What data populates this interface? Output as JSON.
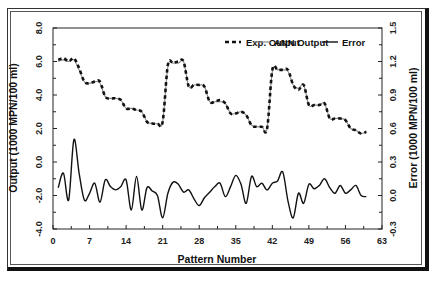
{
  "chart_data": {
    "type": "line",
    "title": "",
    "xlabel": "Pattern Number",
    "ylabel": "Output (1000 MPN/100 ml)",
    "y2label": "Error (1000 MPN/100 ml)",
    "xlim": [
      0,
      63
    ],
    "ylim": [
      -4.0,
      8.0
    ],
    "y2lim": [
      -0.3,
      1.5
    ],
    "x_ticks": [
      "0",
      "7",
      "14",
      "21",
      "28",
      "35",
      "42",
      "49",
      "56",
      "63"
    ],
    "y_ticks": [
      "-4.0",
      "-2.0",
      "0.0",
      "2.0",
      "4.0",
      "6.0",
      "8.0"
    ],
    "y2_ticks": [
      "-0.3",
      "0.0",
      "0.3",
      "0.6",
      "0.9",
      "1.2",
      "1.5"
    ],
    "grid": false,
    "legend_position": "top-right inside",
    "x": [
      1,
      2,
      3,
      4,
      5,
      6,
      7,
      8,
      9,
      10,
      11,
      12,
      13,
      14,
      15,
      16,
      17,
      18,
      19,
      20,
      21,
      22,
      23,
      24,
      25,
      26,
      27,
      28,
      29,
      30,
      31,
      32,
      33,
      34,
      35,
      36,
      37,
      38,
      39,
      40,
      41,
      42,
      43,
      44,
      45,
      46,
      47,
      48,
      49,
      50,
      51,
      52,
      53,
      54,
      55,
      56,
      57,
      58,
      59,
      60
    ],
    "series": [
      {
        "name": "Exp. Output",
        "axis": "left",
        "style": "dashed",
        "color": "#111111",
        "values": [
          6.1,
          6.2,
          6.0,
          6.2,
          5.6,
          4.8,
          4.7,
          4.8,
          4.8,
          3.9,
          3.8,
          3.8,
          3.7,
          3.2,
          3.2,
          3.1,
          3.0,
          2.4,
          2.3,
          2.3,
          2.4,
          5.8,
          5.9,
          6.0,
          6.0,
          4.5,
          4.6,
          4.6,
          4.5,
          3.6,
          3.6,
          3.7,
          3.5,
          2.9,
          2.9,
          3.0,
          2.8,
          2.2,
          2.1,
          2.1,
          2.0,
          5.5,
          5.5,
          5.5,
          5.5,
          4.6,
          4.3,
          4.6,
          3.4,
          3.4,
          3.4,
          3.5,
          2.6,
          2.6,
          2.6,
          2.5,
          2.0,
          1.9,
          1.7,
          1.8
        ]
      },
      {
        "name": "ANN Output",
        "axis": "left",
        "style": "solid",
        "color": "#888888",
        "values": [
          6.0,
          6.1,
          6.0,
          6.1,
          5.5,
          4.8,
          4.7,
          4.8,
          4.7,
          3.9,
          3.8,
          3.8,
          3.7,
          3.2,
          3.2,
          3.1,
          3.0,
          2.4,
          2.3,
          2.3,
          2.4,
          5.7,
          5.9,
          5.9,
          6.0,
          4.5,
          4.6,
          4.6,
          4.5,
          3.6,
          3.6,
          3.6,
          3.5,
          2.9,
          2.9,
          3.0,
          2.8,
          2.2,
          2.1,
          2.1,
          2.0,
          5.4,
          5.5,
          5.5,
          5.4,
          4.6,
          4.4,
          4.6,
          3.4,
          3.4,
          3.4,
          3.5,
          2.6,
          2.6,
          2.6,
          2.5,
          2.0,
          1.9,
          1.7,
          1.8
        ]
      },
      {
        "name": "Error",
        "axis": "right",
        "style": "solid",
        "color": "#111111",
        "values": [
          0.07,
          0.2,
          -0.04,
          0.5,
          0.2,
          -0.04,
          0.02,
          0.11,
          -0.06,
          0.14,
          0.08,
          0.05,
          0.08,
          0.14,
          -0.13,
          0.17,
          -0.13,
          0.07,
          0.04,
          0.0,
          -0.2,
          0.02,
          0.12,
          0.1,
          0.03,
          0.05,
          -0.03,
          -0.09,
          -0.02,
          0.03,
          0.08,
          0.11,
          -0.01,
          0.08,
          0.18,
          0.1,
          -0.07,
          0.17,
          0.08,
          0.11,
          0.05,
          0.11,
          0.13,
          0.21,
          -0.05,
          -0.2,
          0.02,
          -0.07,
          0.1,
          0.06,
          0.09,
          0.15,
          0.07,
          0.02,
          0.09,
          0.02,
          0.05,
          0.09,
          0.0,
          -0.01
        ]
      }
    ]
  },
  "legend": {
    "items": [
      {
        "label": "Exp. Output"
      },
      {
        "label": "ANN Output"
      },
      {
        "label": "Error"
      }
    ]
  },
  "axes": {
    "xlabel": "Pattern Number",
    "ylabel": "Output (1000 MPN/100 ml)",
    "y2label": "Error (1000 MPN/100 ml)"
  }
}
